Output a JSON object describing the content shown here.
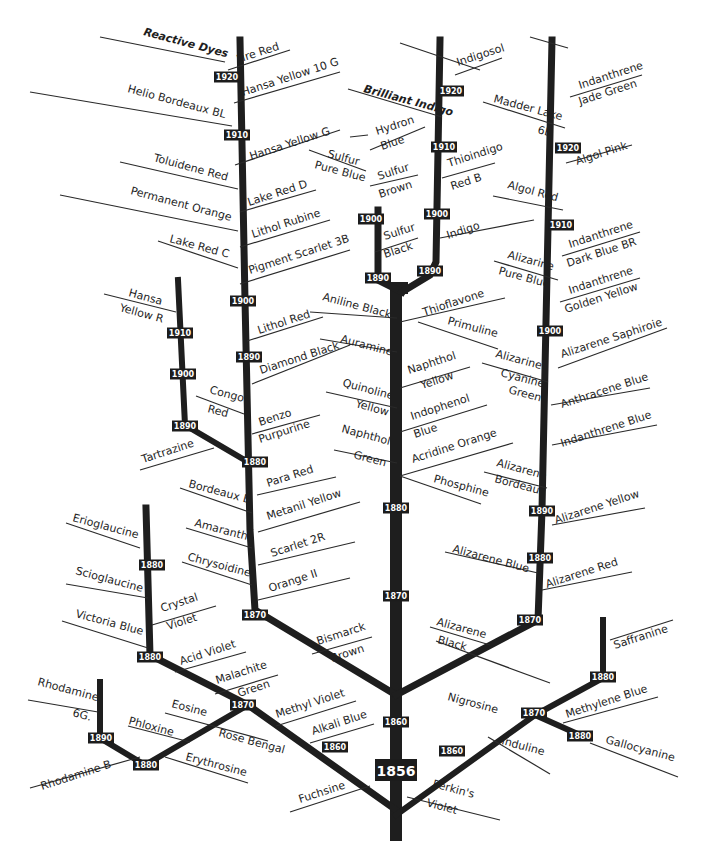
{
  "diagram": {
    "root": {
      "year": "1856",
      "label": "Perkin's Violet"
    },
    "colors": {
      "ink": "#1e1e1e",
      "background": "#ffffff",
      "year_box": "#1c1c1c",
      "year_text": "#ffffff"
    },
    "branches": [
      {
        "id": "trunk",
        "d": "M396 835 L396 288 L402 288"
      },
      {
        "id": "trunk-fork-left",
        "d": "M402 292 L378 280 L378 210"
      },
      {
        "id": "trunk-fork-right",
        "d": "M402 292 L430 275 L436 262 L440 40"
      },
      {
        "id": "azo-main",
        "d": "M396 695 L255 610 L250 530 L245 300 L240 40"
      },
      {
        "id": "azo-sub",
        "d": "M248 462 L185 425 L178 280"
      },
      {
        "id": "triphenyl",
        "d": "M396 810 L248 705 L150 655 L146 508"
      },
      {
        "id": "xanthene",
        "d": "M248 705 L145 765 L100 738 L100 682"
      },
      {
        "id": "alizarin",
        "d": "M396 695 L538 620 L542 510 L552 40"
      },
      {
        "id": "azine",
        "d": "M396 815 L535 715 L603 678 L603 620"
      },
      {
        "id": "oxazine",
        "d": "M535 715 L580 735"
      }
    ],
    "widths": {
      "trunk": 12,
      "trunk-fork-left": 7,
      "trunk-fork-right": 7,
      "azo-main": 7,
      "azo-sub": 6,
      "triphenyl": 7,
      "xanthene": 6,
      "alizarin": 7,
      "azine": 6,
      "oxazine": 6
    },
    "year_markers": [
      {
        "year": "1856",
        "x": 396,
        "y": 770,
        "big": true
      },
      {
        "year": "1860",
        "x": 396,
        "y": 722
      },
      {
        "year": "1870",
        "x": 396,
        "y": 596
      },
      {
        "year": "1880",
        "x": 396,
        "y": 508
      },
      {
        "year": "1920",
        "x": 227,
        "y": 77
      },
      {
        "year": "1910",
        "x": 237,
        "y": 135
      },
      {
        "year": "1900",
        "x": 243,
        "y": 301
      },
      {
        "year": "1890",
        "x": 249,
        "y": 357
      },
      {
        "year": "1880",
        "x": 255,
        "y": 462
      },
      {
        "year": "1870",
        "x": 255,
        "y": 615
      },
      {
        "year": "1910",
        "x": 180,
        "y": 333
      },
      {
        "year": "1900",
        "x": 183,
        "y": 374
      },
      {
        "year": "1890",
        "x": 185,
        "y": 426
      },
      {
        "year": "1900",
        "x": 371,
        "y": 219
      },
      {
        "year": "1890",
        "x": 378,
        "y": 278
      },
      {
        "year": "1920",
        "x": 451,
        "y": 91
      },
      {
        "year": "1910",
        "x": 444,
        "y": 147
      },
      {
        "year": "1900",
        "x": 437,
        "y": 214
      },
      {
        "year": "1890",
        "x": 430,
        "y": 271
      },
      {
        "year": "1920",
        "x": 568,
        "y": 148
      },
      {
        "year": "1910",
        "x": 561,
        "y": 225
      },
      {
        "year": "1900",
        "x": 550,
        "y": 331
      },
      {
        "year": "1890",
        "x": 542,
        "y": 511
      },
      {
        "year": "1880",
        "x": 540,
        "y": 558
      },
      {
        "year": "1870",
        "x": 530,
        "y": 620
      },
      {
        "year": "1880",
        "x": 152,
        "y": 565
      },
      {
        "year": "1880",
        "x": 150,
        "y": 657
      },
      {
        "year": "1870",
        "x": 243,
        "y": 705
      },
      {
        "year": "1860",
        "x": 335,
        "y": 747
      },
      {
        "year": "1890",
        "x": 101,
        "y": 738
      },
      {
        "year": "1880",
        "x": 146,
        "y": 765
      },
      {
        "year": "1860",
        "x": 452,
        "y": 751
      },
      {
        "year": "1870",
        "x": 534,
        "y": 713
      },
      {
        "year": "1880",
        "x": 603,
        "y": 677
      },
      {
        "year": "1880",
        "x": 580,
        "y": 736
      }
    ],
    "leaders": [
      {
        "d": "M100 37 L225 62"
      },
      {
        "d": "M228 70 L290 50"
      },
      {
        "d": "M30 92 L232 126"
      },
      {
        "d": "M234 103 L340 72"
      },
      {
        "d": "M235 165 L340 130"
      },
      {
        "d": "M120 162 L238 189"
      },
      {
        "d": "M240 212 L316 190"
      },
      {
        "d": "M60 195 L238 231"
      },
      {
        "d": "M240 247 L330 220"
      },
      {
        "d": "M158 241 L238 268"
      },
      {
        "d": "M240 284 L350 250"
      },
      {
        "d": "M104 294 L176 312"
      },
      {
        "d": "M247 341 L323 317"
      },
      {
        "d": "M252 384 L350 345"
      },
      {
        "d": "M196 396 L244 414"
      },
      {
        "d": "M252 434 L320 415"
      },
      {
        "d": "M140 470 L214 448"
      },
      {
        "d": "M257 495 L336 477"
      },
      {
        "d": "M180 488 L252 513"
      },
      {
        "d": "M258 532 L360 502"
      },
      {
        "d": "M186 528 L252 548"
      },
      {
        "d": "M258 565 L355 542"
      },
      {
        "d": "M182 562 L252 585"
      },
      {
        "d": "M258 600 L350 578"
      },
      {
        "d": "M66 523 L140 548"
      },
      {
        "d": "M66 584 L148 598"
      },
      {
        "d": "M152 625 L216 606"
      },
      {
        "d": "M62 621 L148 648"
      },
      {
        "d": "M175 672 L246 652"
      },
      {
        "d": "M215 694 L278 675"
      },
      {
        "d": "M276 726 L356 701"
      },
      {
        "d": "M310 743 L374 724"
      },
      {
        "d": "M312 654 L372 637"
      },
      {
        "d": "M28 700 L98 712"
      },
      {
        "d": "M30 788 L140 757"
      },
      {
        "d": "M165 713 L268 741"
      },
      {
        "d": "M128 726 L190 742"
      },
      {
        "d": "M165 757 L248 783"
      },
      {
        "d": "M290 812 L370 786"
      },
      {
        "d": "M407 797 L500 820"
      },
      {
        "d": "M350 137 L368 135"
      },
      {
        "d": "M309 150 L366 171"
      },
      {
        "d": "M370 186 L418 175"
      },
      {
        "d": "M375 252 L418 238"
      },
      {
        "d": "M370 150 L425 127"
      },
      {
        "d": "M400 43 L480 70"
      },
      {
        "d": "M455 75 L502 58"
      },
      {
        "d": "M348 89 L442 117"
      },
      {
        "d": "M442 178 L495 163"
      },
      {
        "d": "M440 238 L534 220"
      },
      {
        "d": "M530 37 L568 48"
      },
      {
        "d": "M570 97 L642 75"
      },
      {
        "d": "M483 102 L565 128"
      },
      {
        "d": "M566 163 L632 145"
      },
      {
        "d": "M493 196 L563 210"
      },
      {
        "d": "M562 256 L640 232"
      },
      {
        "d": "M494 261 L558 280"
      },
      {
        "d": "M560 302 L640 278"
      },
      {
        "d": "M558 368 L667 328"
      },
      {
        "d": "M482 363 L548 382"
      },
      {
        "d": "M551 405 L650 388"
      },
      {
        "d": "M552 445 L657 425"
      },
      {
        "d": "M484 472 L547 488"
      },
      {
        "d": "M552 525 L645 508"
      },
      {
        "d": "M445 552 L538 573"
      },
      {
        "d": "M542 590 L632 572"
      },
      {
        "d": "M430 627 L490 645"
      },
      {
        "d": "M310 312 L397 318"
      },
      {
        "d": "M320 339 L397 352"
      },
      {
        "d": "M326 392 L397 408"
      },
      {
        "d": "M334 450 L397 463"
      },
      {
        "d": "M400 322 L505 298"
      },
      {
        "d": "M418 322 L498 349"
      },
      {
        "d": "M400 388 L470 367"
      },
      {
        "d": "M400 432 L487 405"
      },
      {
        "d": "M400 476 L513 443"
      },
      {
        "d": "M400 476 L481 504"
      },
      {
        "d": "M436 641 L550 683"
      },
      {
        "d": "M488 737 L550 774"
      },
      {
        "d": "M563 723 L658 697"
      },
      {
        "d": "M610 640 L673 620"
      },
      {
        "d": "M590 743 L678 777"
      }
    ],
    "labels": [
      {
        "text": "Reactive Dyes",
        "x": 143,
        "y": 35,
        "rot": 15,
        "bold": true
      },
      {
        "text": "Fire Red",
        "x": 238,
        "y": 63,
        "rot": -18
      },
      {
        "text": "Hansa Yellow 10 G",
        "x": 243,
        "y": 96,
        "rot": -18
      },
      {
        "text": "Helio Bordeaux BL",
        "x": 127,
        "y": 92,
        "rot": 15
      },
      {
        "text": "Hansa Yellow G",
        "x": 251,
        "y": 160,
        "rot": -18
      },
      {
        "text": "Toluidene Red",
        "x": 153,
        "y": 161,
        "rot": 15
      },
      {
        "text": "Lake Red D",
        "x": 249,
        "y": 206,
        "rot": -18
      },
      {
        "text": "Permanent Orange",
        "x": 130,
        "y": 194,
        "rot": 15
      },
      {
        "text": "Lithol Rubine",
        "x": 253,
        "y": 238,
        "rot": -18
      },
      {
        "text": "Lake Red C",
        "x": 169,
        "y": 242,
        "rot": 15
      },
      {
        "text": "Pigment Scarlet 3B",
        "x": 250,
        "y": 274,
        "rot": -18
      },
      {
        "text": "Hansa",
        "x": 128,
        "y": 296,
        "rot": 15
      },
      {
        "text": "Yellow R",
        "x": 119,
        "y": 311,
        "rot": 15
      },
      {
        "text": "Lithol Red",
        "x": 259,
        "y": 334,
        "rot": -18
      },
      {
        "text": "Diamond Black",
        "x": 261,
        "y": 374,
        "rot": -18
      },
      {
        "text": "Congo",
        "x": 209,
        "y": 393,
        "rot": 15
      },
      {
        "text": "Red",
        "x": 207,
        "y": 412,
        "rot": 15
      },
      {
        "text": "Benzo",
        "x": 260,
        "y": 426,
        "rot": -18
      },
      {
        "text": "Purpurine",
        "x": 260,
        "y": 443,
        "rot": -18
      },
      {
        "text": "Tartrazine",
        "x": 143,
        "y": 463,
        "rot": -18
      },
      {
        "text": "Para Red",
        "x": 268,
        "y": 487,
        "rot": -18
      },
      {
        "text": "Bordeaux B",
        "x": 188,
        "y": 487,
        "rot": 15
      },
      {
        "text": "Metanil Yellow",
        "x": 268,
        "y": 520,
        "rot": -18
      },
      {
        "text": "Amaranth",
        "x": 194,
        "y": 526,
        "rot": 15
      },
      {
        "text": "Scarlet 2R",
        "x": 272,
        "y": 557,
        "rot": -18
      },
      {
        "text": "Chrysoidine",
        "x": 187,
        "y": 560,
        "rot": 15
      },
      {
        "text": "Orange II",
        "x": 270,
        "y": 592,
        "rot": -18
      },
      {
        "text": "Erioglaucine",
        "x": 72,
        "y": 521,
        "rot": 15
      },
      {
        "text": "Scioglaucine",
        "x": 75,
        "y": 574,
        "rot": 15
      },
      {
        "text": "Crystal",
        "x": 162,
        "y": 612,
        "rot": -18
      },
      {
        "text": "Violet",
        "x": 168,
        "y": 630,
        "rot": -18
      },
      {
        "text": "Victoria Blue",
        "x": 75,
        "y": 617,
        "rot": 15
      },
      {
        "text": "Acid Violet",
        "x": 181,
        "y": 665,
        "rot": -18
      },
      {
        "text": "Malachite",
        "x": 217,
        "y": 684,
        "rot": -18
      },
      {
        "text": "Green",
        "x": 239,
        "y": 697,
        "rot": -18
      },
      {
        "text": "Bismarck",
        "x": 318,
        "y": 645,
        "rot": -18
      },
      {
        "text": "Brown",
        "x": 332,
        "y": 662,
        "rot": -18
      },
      {
        "text": "Methyl Violet",
        "x": 277,
        "y": 718,
        "rot": -18
      },
      {
        "text": "Alkali Blue",
        "x": 313,
        "y": 735,
        "rot": -18
      },
      {
        "text": "Rhodamine",
        "x": 37,
        "y": 685,
        "rot": 15
      },
      {
        "text": "6G.",
        "x": 72,
        "y": 716,
        "rot": 15
      },
      {
        "text": "Eosine",
        "x": 171,
        "y": 707,
        "rot": 15
      },
      {
        "text": "Phloxine",
        "x": 128,
        "y": 724,
        "rot": 15
      },
      {
        "text": "Rose Bengal",
        "x": 218,
        "y": 736,
        "rot": 15
      },
      {
        "text": "Erythrosine",
        "x": 185,
        "y": 760,
        "rot": 15
      },
      {
        "text": "Rhodamine B",
        "x": 42,
        "y": 790,
        "rot": -18
      },
      {
        "text": "Fuchsine",
        "x": 300,
        "y": 803,
        "rot": -18
      },
      {
        "text": "Perkin's",
        "x": 432,
        "y": 787,
        "rot": 15
      },
      {
        "text": "Violet",
        "x": 426,
        "y": 806,
        "rot": 15
      },
      {
        "text": "Hydron",
        "x": 377,
        "y": 135,
        "rot": -18
      },
      {
        "text": "Blue",
        "x": 382,
        "y": 150,
        "rot": -18
      },
      {
        "text": "Sulfur",
        "x": 327,
        "y": 157,
        "rot": 15
      },
      {
        "text": "Pure Blue",
        "x": 314,
        "y": 168,
        "rot": 15
      },
      {
        "text": "Sulfur",
        "x": 379,
        "y": 180,
        "rot": -18
      },
      {
        "text": "Brown",
        "x": 380,
        "y": 198,
        "rot": -18
      },
      {
        "text": "Sulfur",
        "x": 385,
        "y": 240,
        "rot": -18
      },
      {
        "text": "Black",
        "x": 385,
        "y": 258,
        "rot": -18
      },
      {
        "text": "Brilliant Indigo",
        "x": 363,
        "y": 92,
        "rot": 15,
        "bold": true
      },
      {
        "text": "Indigosol",
        "x": 458,
        "y": 66,
        "rot": -18
      },
      {
        "text": "Thioindigo",
        "x": 449,
        "y": 167,
        "rot": -18
      },
      {
        "text": "Red B",
        "x": 452,
        "y": 190,
        "rot": -18
      },
      {
        "text": "Indigo",
        "x": 448,
        "y": 239,
        "rot": -18
      },
      {
        "text": "Madder Lake",
        "x": 493,
        "y": 102,
        "rot": 15
      },
      {
        "text": "6B",
        "x": 537,
        "y": 133,
        "rot": 15
      },
      {
        "text": "Indanthrene",
        "x": 580,
        "y": 89,
        "rot": -18
      },
      {
        "text": "Jade Green",
        "x": 580,
        "y": 105,
        "rot": -18
      },
      {
        "text": "Algol Pink",
        "x": 577,
        "y": 165,
        "rot": -18
      },
      {
        "text": "Algol Red",
        "x": 507,
        "y": 188,
        "rot": 15
      },
      {
        "text": "Indanthrene",
        "x": 570,
        "y": 248,
        "rot": -18
      },
      {
        "text": "Dark Blue BR",
        "x": 568,
        "y": 267,
        "rot": -18
      },
      {
        "text": "Alizarine",
        "x": 507,
        "y": 258,
        "rot": 15
      },
      {
        "text": "Pure Blue",
        "x": 498,
        "y": 274,
        "rot": 15
      },
      {
        "text": "Indanthrene",
        "x": 570,
        "y": 294,
        "rot": -18
      },
      {
        "text": "Golden Yellow",
        "x": 566,
        "y": 313,
        "rot": -18
      },
      {
        "text": "Alizarene Saphiroie",
        "x": 562,
        "y": 358,
        "rot": -18
      },
      {
        "text": "Alizarine",
        "x": 495,
        "y": 357,
        "rot": 15
      },
      {
        "text": "Cyanine",
        "x": 500,
        "y": 376,
        "rot": 15
      },
      {
        "text": "Green",
        "x": 508,
        "y": 393,
        "rot": 15
      },
      {
        "text": "Anthracene Blue",
        "x": 562,
        "y": 408,
        "rot": -18
      },
      {
        "text": "Indanthrene Blue",
        "x": 562,
        "y": 447,
        "rot": -18
      },
      {
        "text": "Alizarene",
        "x": 496,
        "y": 466,
        "rot": 15
      },
      {
        "text": "Bordeaux",
        "x": 494,
        "y": 482,
        "rot": 15
      },
      {
        "text": "Alizarene Yellow",
        "x": 556,
        "y": 524,
        "rot": -18
      },
      {
        "text": "Alizarene Blue",
        "x": 452,
        "y": 552,
        "rot": 15
      },
      {
        "text": "Alizarene Red",
        "x": 547,
        "y": 588,
        "rot": -18
      },
      {
        "text": "Alizarene",
        "x": 436,
        "y": 625,
        "rot": 15
      },
      {
        "text": "Black",
        "x": 437,
        "y": 643,
        "rot": 15
      },
      {
        "text": "Aniline Black",
        "x": 322,
        "y": 300,
        "rot": 15
      },
      {
        "text": "Thioflavone",
        "x": 424,
        "y": 316,
        "rot": -18
      },
      {
        "text": "Primuline",
        "x": 447,
        "y": 324,
        "rot": 15
      },
      {
        "text": "Auramine",
        "x": 340,
        "y": 342,
        "rot": 15
      },
      {
        "text": "Naphthol",
        "x": 409,
        "y": 374,
        "rot": -18
      },
      {
        "text": "Yellow",
        "x": 422,
        "y": 389,
        "rot": -18
      },
      {
        "text": "Quinoline",
        "x": 342,
        "y": 386,
        "rot": 15
      },
      {
        "text": "Yellow",
        "x": 355,
        "y": 407,
        "rot": 15
      },
      {
        "text": "Indophenol",
        "x": 412,
        "y": 420,
        "rot": -18
      },
      {
        "text": "Blue",
        "x": 415,
        "y": 438,
        "rot": -18
      },
      {
        "text": "Naphthol",
        "x": 341,
        "y": 432,
        "rot": 15
      },
      {
        "text": "Green",
        "x": 353,
        "y": 458,
        "rot": 15
      },
      {
        "text": "Acridine Orange",
        "x": 413,
        "y": 463,
        "rot": -18
      },
      {
        "text": "Phosphine",
        "x": 433,
        "y": 482,
        "rot": 15
      },
      {
        "text": "Nigrosine",
        "x": 447,
        "y": 700,
        "rot": 15
      },
      {
        "text": "Induline",
        "x": 501,
        "y": 744,
        "rot": 15
      },
      {
        "text": "Methylene Blue",
        "x": 567,
        "y": 718,
        "rot": -18
      },
      {
        "text": "Saffranine",
        "x": 615,
        "y": 649,
        "rot": -18
      },
      {
        "text": "Gallocyanine",
        "x": 605,
        "y": 743,
        "rot": 15
      }
    ]
  }
}
